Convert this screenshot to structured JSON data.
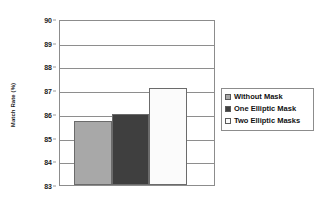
{
  "chart_data": {
    "type": "bar",
    "title": "",
    "xlabel": "",
    "ylabel": "Match Rate (%)",
    "ylim": [
      83,
      90
    ],
    "ytick_labels": [
      "90",
      "89",
      "88",
      "87",
      "86",
      "85",
      "84",
      "83"
    ],
    "ytick_values": [
      90,
      89,
      88,
      87,
      86,
      85,
      84,
      83
    ],
    "grid": true,
    "legend_position": "right",
    "categories": [
      ""
    ],
    "series": [
      {
        "name": "Without Mask",
        "values": [
          85.7
        ],
        "color": "#a8a8a8"
      },
      {
        "name": "One Elliptic Mask",
        "values": [
          86.0
        ],
        "color": "#3f3f3f"
      },
      {
        "name": "Two Elliptic Masks",
        "values": [
          87.1
        ],
        "color": "#fbfbfb"
      }
    ]
  },
  "legend": {
    "items": [
      {
        "label": "Without Mask",
        "color": "#a8a8a8"
      },
      {
        "label": "One Elliptic Mask",
        "color": "#3f3f3f"
      },
      {
        "label": "Two Elliptic Masks",
        "color": "#fbfbfb"
      }
    ]
  }
}
